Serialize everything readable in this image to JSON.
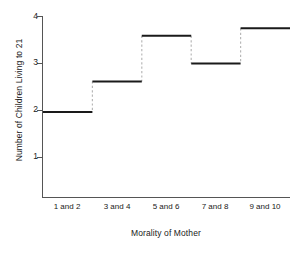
{
  "chart_data": {
    "type": "bar",
    "render_style": "step",
    "title": "",
    "xlabel": "Morality of Mother",
    "ylabel": "Number of Children Living to 21",
    "categories": [
      "1 and 2",
      "3 and 4",
      "5 and 6",
      "7 and 8",
      "9 and 10"
    ],
    "values": [
      1.82,
      2.47,
      3.44,
      2.85,
      3.6
    ],
    "ylim": [
      0,
      4
    ],
    "yticks": [
      1,
      2,
      3,
      4
    ],
    "ytick_labels": [
      "1",
      "2",
      "3",
      "4"
    ],
    "grid": false,
    "legend": null
  },
  "style": {
    "line_color": "#1a1a1a",
    "riser_color": "#b8b8b8",
    "axis_color": "#555555",
    "background": "#ffffff"
  }
}
